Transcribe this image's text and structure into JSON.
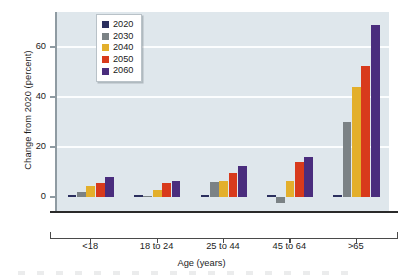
{
  "chart_data": {
    "type": "bar",
    "title": "",
    "subtitle": "",
    "xlabel": "Age (years)",
    "ylabel": "Change from 2020 (percent)",
    "categories": [
      "<18",
      "18 to 24",
      "25 to 44",
      "45 to 64",
      ">65"
    ],
    "series": [
      {
        "name": "2020",
        "color": "#2b2f5e",
        "values": [
          0,
          0,
          0,
          0,
          0
        ]
      },
      {
        "name": "2030",
        "color": "#7b8285",
        "values": [
          2,
          0.5,
          6,
          -2.5,
          30
        ]
      },
      {
        "name": "2040",
        "color": "#e3af2b",
        "values": [
          4.5,
          3,
          6.5,
          6.5,
          44
        ]
      },
      {
        "name": "2050",
        "color": "#d83a1c",
        "values": [
          5.5,
          5.5,
          9.5,
          14,
          52.5
        ]
      },
      {
        "name": "2060",
        "color": "#4a2d7d",
        "values": [
          8,
          6.5,
          12.5,
          16,
          69
        ]
      }
    ],
    "ylim": [
      -6,
      74
    ],
    "yticks": [
      0,
      20,
      40,
      60
    ],
    "ytick_labels": [
      "0",
      "20",
      "40",
      "60"
    ],
    "grid": "horizontal",
    "legend_position": "upper-left",
    "plot_background": "#dfe7ec",
    "gridline_color": "#fbfdfe"
  },
  "legend": {
    "items": [
      {
        "label": "2020"
      },
      {
        "label": "2030"
      },
      {
        "label": "2040"
      },
      {
        "label": "2050"
      },
      {
        "label": "2060"
      }
    ]
  }
}
